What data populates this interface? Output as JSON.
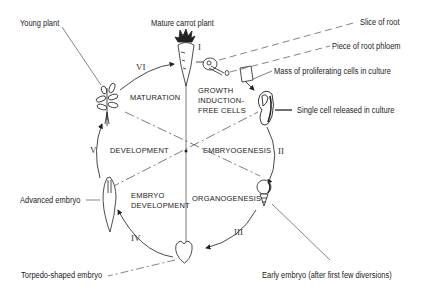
{
  "diagram": {
    "stage_labels": {
      "young_plant": "Young plant",
      "mature_carrot": "Mature carrot plant",
      "slice_of_root": "Slice of root",
      "piece_of_phloem": "Piece of root phloem",
      "mass_of_cells": "Mass of proliferating cells in culture",
      "single_cell": "Single cell released in culture",
      "early_embryo": "Early embryo (after first few diversions)",
      "torpedo_embryo": "Torpedo-shaped embryo",
      "advanced_embryo": "Advanced embryo"
    },
    "segments": {
      "growth_induction": "GROWTH\nINDUCTION-\nFREE CELLS",
      "embryogenesis": "EMBRYOGENESIS",
      "organogenesis": "ORGANOGENESIS",
      "embryo_development": "EMBRYO\nDEVELOPMENT",
      "development": "DEVELOPMENT",
      "maturation": "MATURATION"
    },
    "steps": {
      "i": "I",
      "ii": "II",
      "iii": "III",
      "iv": "IV",
      "v": "V",
      "vi": "VI"
    },
    "colors": {
      "line": "#333333",
      "text": "#222222",
      "background": "#ffffff"
    }
  }
}
